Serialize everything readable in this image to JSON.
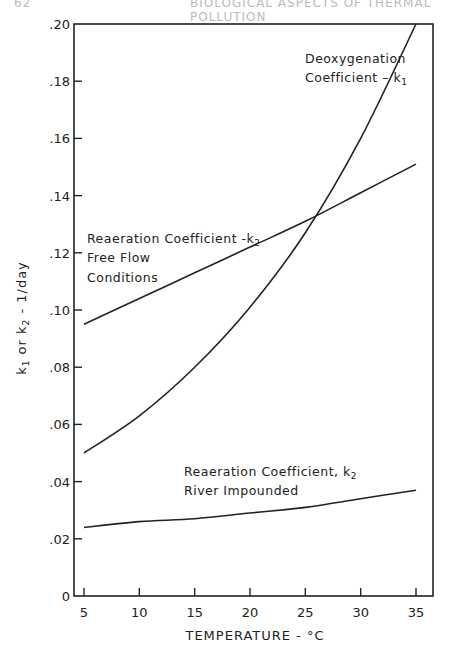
{
  "page": {
    "header_left": "62",
    "header_right": "BIOLOGICAL ASPECTS OF THERMAL POLLUTION"
  },
  "chart_data": {
    "type": "line",
    "title": "",
    "xlabel": "TEMPERATURE - °C",
    "ylabel": "k1 or k2 - 1/day",
    "xlim": [
      4,
      37
    ],
    "ylim": [
      0,
      0.2
    ],
    "grid": false,
    "legend": "inline annotations",
    "x_ticks": [
      5,
      10,
      15,
      20,
      25,
      30,
      35
    ],
    "x_tick_labels": [
      "5",
      "10",
      "15",
      "20",
      "25",
      "30",
      "35"
    ],
    "y_ticks": [
      0,
      0.02,
      0.04,
      0.06,
      0.08,
      0.1,
      0.12,
      0.14,
      0.16,
      0.18,
      0.2
    ],
    "y_tick_labels": [
      "0",
      ".02",
      ".04",
      ".06",
      ".08",
      ".10",
      ".12",
      ".14",
      ".16",
      ".18",
      ".20"
    ],
    "x": [
      5,
      10,
      15,
      20,
      25,
      30,
      35
    ],
    "series": [
      {
        "name": "Deoxygenation Coefficient - k1",
        "annotation_lines": [
          "Deoxygenation",
          "Coefficient – k1"
        ],
        "values": [
          0.05,
          0.063,
          0.08,
          0.101,
          0.127,
          0.16,
          0.2
        ]
      },
      {
        "name": "Reaeration Coefficient - k2 Free Flow Conditions",
        "annotation_lines": [
          "Reaeration Coefficient -k2",
          "Free Flow",
          "Conditions"
        ],
        "values": [
          0.095,
          0.104,
          0.113,
          0.122,
          0.131,
          0.141,
          0.151
        ]
      },
      {
        "name": "Reaeration Coefficient, k2 River Impounded",
        "annotation_lines": [
          "Reaeration Coefficient, k2",
          "River Impounded"
        ],
        "values": [
          0.024,
          0.026,
          0.027,
          0.029,
          0.031,
          0.034,
          0.037
        ]
      }
    ]
  }
}
